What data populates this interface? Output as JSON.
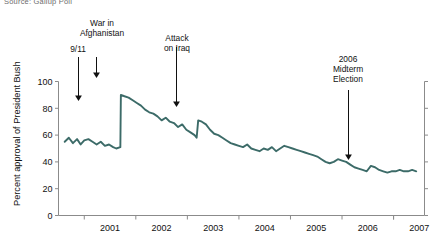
{
  "source_note": "Source: Gallup Poll",
  "axes": {
    "ylabel": "Percent approval of President Bush",
    "yticks": [
      "0",
      "20",
      "40",
      "60",
      "80",
      "100"
    ],
    "xticks": [
      "2001",
      "2002",
      "2003",
      "2004",
      "2005",
      "2006",
      "2007"
    ]
  },
  "annotations": {
    "afghanistan": "War in\nAfghanistan",
    "nine_eleven": "9/11",
    "iraq": "Attack\non Iraq",
    "midterm": "2006\nMidterm\nElection"
  },
  "colors": {
    "line": "#3c6b68",
    "axis": "#8b8b8b",
    "text": "#111111",
    "source": "#6d6d6d"
  },
  "chart_data": {
    "type": "line",
    "title": "",
    "subtitle": "",
    "xlabel": "",
    "ylabel": "Percent approval of President Bush",
    "xlim": [
      2000.5,
      2007.6
    ],
    "ylim": [
      0,
      100
    ],
    "grid": false,
    "legend": null,
    "series": [
      {
        "name": "Presidential approval",
        "x": [
          2000.62,
          2000.7,
          2000.78,
          2000.86,
          2000.93,
          2001.0,
          2001.08,
          2001.16,
          2001.24,
          2001.32,
          2001.4,
          2001.48,
          2001.56,
          2001.62,
          2001.7,
          2001.71,
          2001.78,
          2001.86,
          2001.94,
          2002.02,
          2002.1,
          2002.18,
          2002.26,
          2002.34,
          2002.42,
          2002.5,
          2002.58,
          2002.66,
          2002.74,
          2002.82,
          2002.9,
          2002.98,
          2003.06,
          2003.14,
          2003.18,
          2003.21,
          2003.28,
          2003.36,
          2003.44,
          2003.52,
          2003.6,
          2003.68,
          2003.76,
          2003.84,
          2003.92,
          2004.0,
          2004.08,
          2004.16,
          2004.24,
          2004.32,
          2004.4,
          2004.48,
          2004.56,
          2004.64,
          2004.72,
          2004.8,
          2004.88,
          2004.96,
          2005.04,
          2005.12,
          2005.2,
          2005.28,
          2005.36,
          2005.44,
          2005.52,
          2005.6,
          2005.68,
          2005.76,
          2005.84,
          2005.92,
          2006.0,
          2006.08,
          2006.16,
          2006.24,
          2006.32,
          2006.4,
          2006.48,
          2006.56,
          2006.64,
          2006.72,
          2006.8,
          2006.88,
          2006.96,
          2007.04,
          2007.12,
          2007.2,
          2007.28,
          2007.36,
          2007.44
        ],
        "y": [
          55,
          58,
          54,
          57,
          53,
          56,
          57,
          55,
          53,
          55,
          52,
          53,
          51,
          50,
          51,
          90,
          89,
          88,
          86,
          84,
          82,
          79,
          77,
          76,
          74,
          71,
          73,
          70,
          69,
          66,
          68,
          64,
          62,
          60,
          58,
          71,
          70,
          68,
          64,
          61,
          60,
          58,
          56,
          54,
          53,
          52,
          51,
          53,
          50,
          49,
          48,
          50,
          49,
          51,
          48,
          50,
          52,
          51,
          50,
          49,
          48,
          47,
          46,
          45,
          44,
          42,
          40,
          39,
          40,
          42,
          41,
          40,
          38,
          36,
          35,
          34,
          33,
          37,
          36,
          34,
          33,
          32,
          33,
          33,
          34,
          33,
          33,
          34,
          33
        ]
      }
    ],
    "event_markers": [
      {
        "label": "9/11",
        "x": 2001.7,
        "y_at_event": 51
      },
      {
        "label": "War in Afghanistan",
        "x": 2001.78,
        "y_at_event": 89
      },
      {
        "label": "Attack on Iraq",
        "x": 2003.21,
        "y_at_event": 71
      },
      {
        "label": "2006 Midterm Election",
        "x": 2006.85,
        "y_at_event": 33
      }
    ]
  }
}
